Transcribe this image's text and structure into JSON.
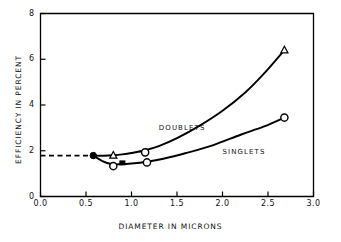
{
  "chart_data": {
    "type": "line",
    "title": "",
    "xlabel": "Diameter in Microns",
    "ylabel": "Efficiency in Percent",
    "xlim": [
      0.0,
      3.0
    ],
    "ylim": [
      0,
      8
    ],
    "xticks": [
      "0.0",
      "0.5",
      "1.0",
      "1.5",
      "2.0",
      "2.5",
      "3.0"
    ],
    "xtick_values": [
      0.0,
      0.5,
      1.0,
      1.5,
      2.0,
      2.5,
      3.0
    ],
    "yticks": [
      "0",
      "2",
      "4",
      "6",
      "8"
    ],
    "ytick_values": [
      0,
      2,
      4,
      6,
      8
    ],
    "grid": false,
    "legend": "inline-annotations",
    "series": [
      {
        "name": "Doublets",
        "marker": "triangle",
        "x": [
          0.58,
          0.8,
          1.15,
          2.68
        ],
        "values": [
          1.79,
          1.8,
          1.93,
          6.4
        ],
        "curve_x": [
          0.58,
          0.7,
          0.8,
          0.9,
          1.0,
          1.15,
          1.3,
          1.5,
          1.75,
          2.0,
          2.25,
          2.45,
          2.68
        ],
        "curve_y": [
          1.79,
          1.78,
          1.8,
          1.84,
          1.9,
          2.02,
          2.2,
          2.55,
          3.1,
          3.75,
          4.55,
          5.35,
          6.4
        ]
      },
      {
        "name": "Singlets",
        "marker": "circle",
        "x": [
          0.58,
          0.8,
          0.88,
          1.17,
          2.68
        ],
        "values": [
          1.79,
          1.33,
          1.45,
          1.49,
          3.45
        ],
        "curve_x": [
          0.58,
          0.68,
          0.78,
          0.88,
          1.0,
          1.17,
          1.35,
          1.6,
          1.9,
          2.2,
          2.45,
          2.68
        ],
        "curve_y": [
          1.79,
          1.55,
          1.42,
          1.41,
          1.44,
          1.52,
          1.65,
          1.9,
          2.25,
          2.7,
          3.05,
          3.45
        ]
      }
    ],
    "reference_line": {
      "name": "baseline-dashed",
      "style": "dashed",
      "y": 1.79,
      "x_start": 0.0,
      "x_end": 0.58
    },
    "markers": [
      {
        "shape": "filled-circle",
        "x": 0.58,
        "y": 1.79
      },
      {
        "shape": "triangle",
        "x": 0.8,
        "y": 1.8
      },
      {
        "shape": "open-circle",
        "x": 0.8,
        "y": 1.33
      },
      {
        "shape": "filled-square",
        "x": 0.9,
        "y": 1.47
      },
      {
        "shape": "open-circle",
        "x": 1.15,
        "y": 1.93
      },
      {
        "shape": "open-circle",
        "x": 1.17,
        "y": 1.49
      },
      {
        "shape": "triangle",
        "x": 2.68,
        "y": 6.4
      },
      {
        "shape": "open-circle",
        "x": 2.68,
        "y": 3.45
      }
    ],
    "annotations": [
      {
        "text": "Doublets",
        "x": 1.3,
        "y": 3.0
      },
      {
        "text": "Singlets",
        "x": 2.0,
        "y": 1.95
      }
    ]
  },
  "axes": {
    "x_title": "DIAMETER IN MICRONS",
    "y_title": "EFFICIENCY IN PERCENT",
    "x_tick_labels": [
      "0.0",
      "0.5",
      "1.0",
      "1.5",
      "2.0",
      "2.5",
      "3.0"
    ],
    "y_tick_labels": [
      "0",
      "2",
      "4",
      "6",
      "8"
    ]
  },
  "labels": {
    "doublets": "DOUBLETS",
    "singlets": "SINGLETS"
  },
  "colors": {
    "ink": "#000000",
    "background": "#ffffff"
  }
}
